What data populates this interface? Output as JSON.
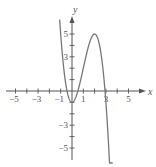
{
  "chart_data": {
    "type": "line",
    "title": "",
    "xlabel": "x",
    "ylabel": "y",
    "xlim": [
      -6,
      6.5
    ],
    "ylim": [
      -6,
      6.5
    ],
    "grid": false,
    "x_ticks": [
      -5,
      -4,
      -3,
      -2,
      -1,
      1,
      2,
      3,
      4,
      5
    ],
    "x_tick_labels": [
      "-5",
      "-3",
      "-1",
      "1",
      "3",
      "5"
    ],
    "x_tick_label_values": [
      -5,
      -3,
      -1,
      1,
      3,
      5
    ],
    "y_ticks": [
      -5,
      -4,
      -3,
      -2,
      -1,
      1,
      2,
      3,
      4,
      5
    ],
    "y_tick_labels": [
      "5",
      "3",
      "-3",
      "-5"
    ],
    "y_tick_label_values": [
      5,
      3,
      -3,
      -5
    ],
    "series": [
      {
        "name": "f(x)",
        "description": "cubic with local minimum at (0, -1) and local maximum at (2, 5), decreasing for x > 2",
        "key_points": [
          {
            "x": -1.1,
            "y": 6.5
          },
          {
            "x": -0.5,
            "y": 0
          },
          {
            "x": 0,
            "y": -1
          },
          {
            "x": 2,
            "y": 5
          },
          {
            "x": 2.9,
            "y": 0
          },
          {
            "x": 3.6,
            "y": -6.5
          }
        ],
        "x": [
          -1.1,
          -1.0,
          -0.8,
          -0.6,
          -0.4,
          -0.2,
          0,
          0.4,
          0.8,
          1.2,
          1.6,
          2.0,
          2.4,
          2.8,
          3.0,
          3.2,
          3.4,
          3.6
        ],
        "values": [
          6.44,
          5.0,
          2.65,
          0.94,
          -0.18,
          -0.81,
          -1.0,
          -0.38,
          1.11,
          2.89,
          4.38,
          5.0,
          4.18,
          1.35,
          -1.0,
          -3.07,
          -6.01,
          -6.33
        ]
      }
    ],
    "legend": null
  },
  "labels": {
    "x_axis": "x",
    "y_axis": "y",
    "x_ticks": [
      {
        "v": -5,
        "t": "−5"
      },
      {
        "v": -3,
        "t": "−3"
      },
      {
        "v": -1,
        "t": "−1"
      },
      {
        "v": 1,
        "t": "1"
      },
      {
        "v": 3,
        "t": "3"
      },
      {
        "v": 5,
        "t": "5"
      }
    ],
    "y_ticks": [
      {
        "v": 5,
        "t": "5"
      },
      {
        "v": 3,
        "t": "3"
      },
      {
        "v": -3,
        "t": "−3"
      },
      {
        "v": -5,
        "t": "−5"
      }
    ]
  },
  "colors": {
    "axis": "#555555",
    "curve": "#777777",
    "text": "#555555",
    "background": "#ffffff"
  }
}
